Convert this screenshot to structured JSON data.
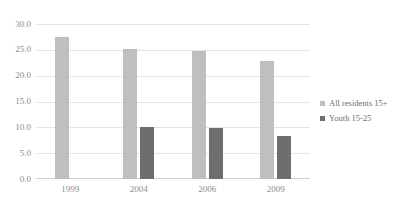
{
  "chart_data": {
    "type": "bar",
    "title": "",
    "subtitle": "",
    "xlabel": "",
    "ylabel": "",
    "categories": [
      "1999",
      "2004",
      "2006",
      "2009"
    ],
    "series": [
      {
        "name": "All residents 15+",
        "color": "#bfbfbf",
        "values": [
          27.5,
          25.2,
          24.8,
          22.9
        ]
      },
      {
        "name": "Youth 15-25",
        "color": "#6e6e6e",
        "values": [
          null,
          10.1,
          9.8,
          8.4
        ]
      }
    ],
    "ylim": [
      0.0,
      30.0
    ],
    "ytick_step": 5.0,
    "ytick_labels": [
      "30.0",
      "25.0",
      "20.0",
      "15.0",
      "10.0",
      "5.0",
      "0.0"
    ],
    "ytick_values": [
      30.0,
      25.0,
      20.0,
      15.0,
      10.0,
      5.0,
      0.0
    ],
    "grid": true,
    "grid_color": "#e4e4e4",
    "legend_position": "right",
    "background_color": "#ffffff",
    "text_color": "#8c8c8c"
  }
}
